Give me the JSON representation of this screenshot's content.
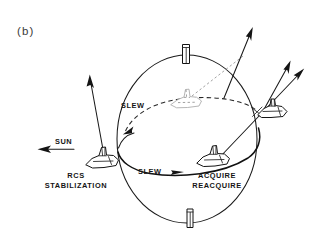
{
  "figure": {
    "caption": "(b)",
    "type": "line-art-technical-diagram",
    "background_color": "#ffffff",
    "ink_color": "#141414",
    "ghost_ink_color": "#a9a9a9"
  },
  "labels": {
    "sun": "SUN",
    "slew_upper": "SLEW",
    "slew_lower": "SLEW",
    "rcs_line1": "RCS",
    "rcs_line2": "STABILIZATION",
    "acquire_line1": "ACQUIRE",
    "acquire_line2": "REACQUIRE"
  },
  "elements": {
    "sphere": {
      "name": "celestial-sphere",
      "center_x": 187,
      "center_y": 139,
      "radius_x": 70,
      "radius_y": 84
    },
    "poles": [
      {
        "name": "north-pole-cylinder",
        "x": 186,
        "y": 50
      },
      {
        "name": "south-pole-cylinder",
        "x": 190,
        "y": 215
      }
    ],
    "shuttles": [
      {
        "name": "shuttle-rcs-stabilization",
        "x": 103,
        "y": 158,
        "style": "solid"
      },
      {
        "name": "shuttle-center-ghost",
        "x": 187,
        "y": 98,
        "style": "ghost"
      },
      {
        "name": "shuttle-acquire",
        "x": 215,
        "y": 157,
        "style": "solid"
      },
      {
        "name": "shuttle-right-edge",
        "x": 272,
        "y": 113,
        "style": "solid"
      }
    ],
    "arrows": [
      {
        "name": "sun-direction-arrow",
        "direction": "left"
      },
      {
        "name": "boresight-arrow-rcs",
        "direction": "up"
      },
      {
        "name": "boresight-arrow-upper-right",
        "direction": "up-right"
      },
      {
        "name": "boresight-arrow-middle-right",
        "direction": "up-right"
      },
      {
        "name": "boresight-arrow-lower-right",
        "direction": "up-right"
      },
      {
        "name": "slew-arrow-upper-dashed",
        "direction": "left"
      },
      {
        "name": "slew-arrow-lower-solid",
        "direction": "right"
      }
    ],
    "paths": [
      {
        "name": "slew-path-upper-dashed",
        "style": "dashed"
      },
      {
        "name": "slew-path-lower-solid",
        "style": "solid"
      },
      {
        "name": "sight-line-dashed-fine",
        "style": "fine-dashed"
      }
    ]
  }
}
